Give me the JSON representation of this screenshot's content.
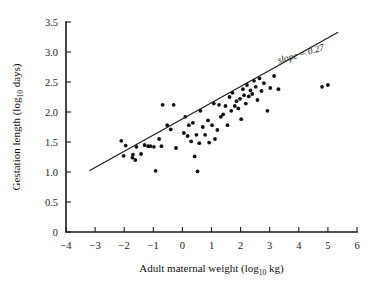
{
  "chart_data": {
    "type": "scatter",
    "title": "",
    "xlabel": "Adult maternal weight (log10 kg)",
    "xlabel_main": "Adult maternal weight (log",
    "xlabel_sub": "10",
    "xlabel_tail": " kg)",
    "ylabel": "Gestation length (log10 days)",
    "ylabel_main": "Gestation length (log",
    "ylabel_sub": "10",
    "ylabel_tail": " days)",
    "xlim": [
      -4,
      6
    ],
    "ylim": [
      0,
      3.5
    ],
    "xticks": [
      -4,
      -3,
      -2,
      -1,
      0,
      1,
      2,
      3,
      4,
      5,
      6
    ],
    "xtick_labels": [
      "−4",
      "−3",
      "−2",
      "−1",
      "0",
      "1",
      "2",
      "3",
      "4",
      "5",
      "6"
    ],
    "yticks": [
      0,
      0.5,
      1.0,
      1.5,
      2.0,
      2.5,
      3.0,
      3.5
    ],
    "ytick_labels": [
      "0",
      "0.5",
      "1.0",
      "1.5",
      "2.0",
      "2.5",
      "3.0",
      "3.5"
    ],
    "grid": false,
    "legend": false,
    "annotations": [
      {
        "text": "slope = 0.27",
        "x": 4.1,
        "y": 2.92,
        "rotation": -16.5
      }
    ],
    "fit_line": {
      "slope": 0.27,
      "label": "slope = 0.27",
      "x_start": -3.2,
      "y_start": 1.02,
      "x_end": 5.35,
      "y_end": 3.33
    },
    "point_color": "#121212",
    "line_color": "#1a1a1a",
    "axis_color": "#1a1a1a",
    "points": [
      [
        -2.1,
        1.52
      ],
      [
        -2.02,
        1.27
      ],
      [
        -1.95,
        1.44
      ],
      [
        -1.72,
        1.24
      ],
      [
        -1.7,
        1.29
      ],
      [
        -1.62,
        1.2
      ],
      [
        -1.58,
        1.42
      ],
      [
        -1.42,
        1.3
      ],
      [
        -1.3,
        1.45
      ],
      [
        -1.18,
        1.43
      ],
      [
        -1.1,
        1.43
      ],
      [
        -0.98,
        1.42
      ],
      [
        -0.92,
        1.02
      ],
      [
        -0.8,
        1.55
      ],
      [
        -0.72,
        1.43
      ],
      [
        -0.68,
        2.12
      ],
      [
        -0.52,
        1.78
      ],
      [
        -0.4,
        1.71
      ],
      [
        -0.3,
        2.12
      ],
      [
        -0.22,
        1.4
      ],
      [
        0.05,
        1.65
      ],
      [
        0.1,
        1.92
      ],
      [
        0.18,
        1.6
      ],
      [
        0.22,
        1.78
      ],
      [
        0.3,
        1.51
      ],
      [
        0.36,
        1.82
      ],
      [
        0.42,
        1.26
      ],
      [
        0.48,
        1.62
      ],
      [
        0.52,
        1.01
      ],
      [
        0.58,
        1.48
      ],
      [
        0.62,
        2.02
      ],
      [
        0.7,
        1.75
      ],
      [
        0.78,
        1.62
      ],
      [
        0.88,
        1.86
      ],
      [
        0.92,
        1.49
      ],
      [
        1.02,
        1.78
      ],
      [
        1.08,
        2.14
      ],
      [
        1.12,
        1.55
      ],
      [
        1.2,
        1.7
      ],
      [
        1.26,
        2.12
      ],
      [
        1.32,
        1.92
      ],
      [
        1.4,
        1.96
      ],
      [
        1.48,
        2.1
      ],
      [
        1.55,
        1.78
      ],
      [
        1.62,
        2.25
      ],
      [
        1.68,
        2.02
      ],
      [
        1.72,
        2.32
      ],
      [
        1.8,
        2.1
      ],
      [
        1.86,
        2.18
      ],
      [
        1.92,
        2.06
      ],
      [
        1.98,
        2.22
      ],
      [
        2.02,
        1.88
      ],
      [
        2.08,
        2.38
      ],
      [
        2.12,
        2.28
      ],
      [
        2.18,
        2.14
      ],
      [
        2.22,
        2.45
      ],
      [
        2.28,
        2.26
      ],
      [
        2.34,
        2.36
      ],
      [
        2.4,
        2.3
      ],
      [
        2.46,
        2.52
      ],
      [
        2.52,
        2.42
      ],
      [
        2.58,
        2.2
      ],
      [
        2.65,
        2.56
      ],
      [
        2.72,
        2.35
      ],
      [
        2.8,
        2.48
      ],
      [
        2.92,
        2.02
      ],
      [
        3.02,
        2.4
      ],
      [
        3.15,
        2.6
      ],
      [
        3.3,
        2.38
      ],
      [
        4.8,
        2.42
      ],
      [
        5.0,
        2.45
      ]
    ]
  }
}
